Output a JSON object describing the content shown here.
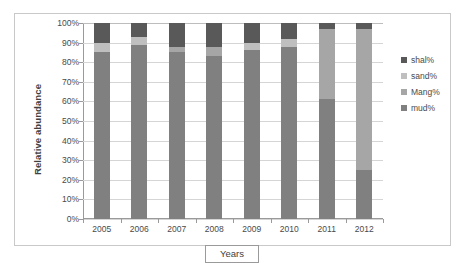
{
  "chart_data": {
    "type": "bar",
    "subtype": "stacked-100-percent",
    "title": "",
    "xlabel": "Years",
    "ylabel": "Relative abundance",
    "categories": [
      "2005",
      "2006",
      "2007",
      "2008",
      "2009",
      "2010",
      "2011",
      "2012"
    ],
    "ylim": [
      0,
      100
    ],
    "ytick_labels": [
      "0%",
      "10%",
      "20%",
      "30%",
      "40%",
      "50%",
      "60%",
      "70%",
      "80%",
      "90%",
      "100%"
    ],
    "ytick_values": [
      0,
      10,
      20,
      30,
      40,
      50,
      60,
      70,
      80,
      90,
      100
    ],
    "grid": true,
    "legend_position": "right",
    "stack_order_bottom_to_top": [
      "mud%",
      "Mang%",
      "sand%",
      "shal%"
    ],
    "series": [
      {
        "name": "mud%",
        "color": "#808080",
        "values": [
          85,
          89,
          85,
          83,
          86,
          88,
          61,
          25
        ]
      },
      {
        "name": "Mang%",
        "color": "#a6a6a6",
        "values": [
          0,
          0,
          3,
          5,
          0,
          0,
          36,
          72
        ]
      },
      {
        "name": "sand%",
        "color": "#bfbfbf",
        "values": [
          5,
          4,
          0,
          0,
          4,
          4,
          0,
          0
        ]
      },
      {
        "name": "shal%",
        "color": "#595959",
        "values": [
          10,
          7,
          12,
          12,
          10,
          8,
          3,
          3
        ]
      }
    ]
  },
  "legend": {
    "items": [
      {
        "label": "shal%",
        "color": "#595959"
      },
      {
        "label": "sand%",
        "color": "#bfbfbf"
      },
      {
        "label": "Mang%",
        "color": "#a6a6a6"
      },
      {
        "label": "mud%",
        "color": "#808080"
      }
    ]
  }
}
